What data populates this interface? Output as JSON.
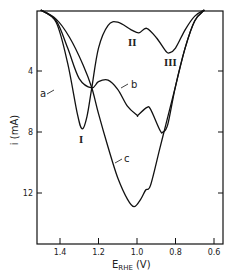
{
  "chart_data": {
    "type": "line",
    "title": "",
    "xlabel": "E_RHE (V)",
    "xlabel_main": "E",
    "xlabel_sub": "RHE",
    "xlabel_unit": "(V)",
    "ylabel": "i (mA)",
    "xlim": [
      1.5,
      0.56
    ],
    "ylim": [
      0,
      15.3
    ],
    "x_inverted": true,
    "y_inverted": true,
    "x_ticks": [
      1.4,
      1.2,
      1.0,
      0.8,
      0.6
    ],
    "x_tick_labels": [
      "1.4",
      "1.2",
      "1.0",
      "0.8",
      "0.6"
    ],
    "y_ticks": [
      4,
      8,
      12
    ],
    "y_tick_labels": [
      "4",
      "8",
      "12"
    ],
    "grid": false,
    "legend": "inline curve labels",
    "series": [
      {
        "name": "a",
        "x": [
          1.5,
          1.42,
          1.36,
          1.31,
          1.285,
          1.26,
          1.235,
          1.2,
          1.15,
          1.1,
          1.03,
          0.99,
          0.95,
          0.9,
          0.85,
          0.83,
          0.8,
          0.75,
          0.7,
          0.65
        ],
        "y": [
          0.0,
          0.8,
          3.5,
          6.8,
          7.8,
          7.0,
          5.1,
          2.5,
          1.0,
          0.8,
          1.3,
          1.5,
          1.2,
          1.8,
          2.7,
          2.8,
          2.5,
          1.3,
          0.4,
          0.0
        ]
      },
      {
        "name": "b",
        "x": [
          1.5,
          1.42,
          1.36,
          1.3,
          1.235,
          1.2,
          1.15,
          1.1,
          1.05,
          1.0,
          0.995,
          0.95,
          0.93,
          0.88,
          0.865,
          0.84,
          0.8,
          0.75,
          0.7,
          0.65
        ],
        "y": [
          0.0,
          0.7,
          2.5,
          4.5,
          5.1,
          4.7,
          4.6,
          5.2,
          6.3,
          6.9,
          6.9,
          6.4,
          6.5,
          7.9,
          8.0,
          7.5,
          5.0,
          2.5,
          0.7,
          0.0
        ]
      },
      {
        "name": "c",
        "x": [
          1.5,
          1.42,
          1.35,
          1.28,
          1.235,
          1.2,
          1.15,
          1.1,
          1.05,
          1.015,
          0.98,
          0.955,
          0.93,
          0.88,
          0.85,
          0.8,
          0.75,
          0.7,
          0.65
        ],
        "y": [
          0.0,
          0.6,
          1.8,
          3.6,
          5.1,
          6.8,
          9.0,
          11.0,
          12.4,
          12.9,
          12.4,
          11.8,
          11.5,
          9.0,
          7.5,
          5.0,
          2.5,
          0.7,
          0.0
        ]
      }
    ],
    "annotations": [
      {
        "text": "a",
        "type": "curve-label"
      },
      {
        "text": "b",
        "type": "curve-label"
      },
      {
        "text": "c",
        "type": "curve-label"
      },
      {
        "text": "I",
        "type": "peak-label",
        "x": 1.285,
        "y": 7.8
      },
      {
        "text": "II",
        "type": "peak-label",
        "x": 0.99,
        "y": 1.5
      },
      {
        "text": "III",
        "type": "peak-label",
        "x": 0.83,
        "y": 2.8
      }
    ]
  }
}
